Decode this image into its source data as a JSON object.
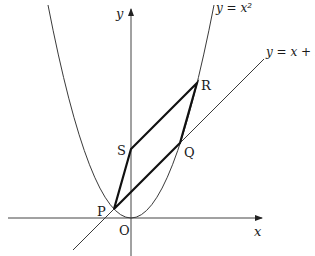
{
  "diagram": {
    "axes": {
      "x_label": "x",
      "y_label": "y",
      "origin_label": "O"
    },
    "curves": {
      "parabola_label": "y = x²",
      "line_label": "y = x + k"
    },
    "points": {
      "P": "P",
      "Q": "Q",
      "R": "R",
      "S": "S"
    },
    "colors": {
      "thin_line": "#3a3a3a",
      "thick_line": "#111111",
      "text": "#1a1a1a"
    }
  }
}
